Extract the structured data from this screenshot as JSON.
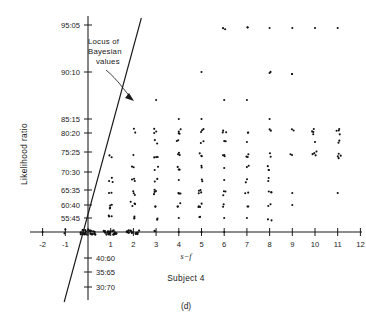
{
  "figure": {
    "panel_label": "(d)",
    "subject_label": "Subject 4",
    "x_axis_title": "s−f",
    "y_axis_title": "Likelihood ratio",
    "annotation": {
      "line1": "Locus of",
      "line2": "Bayesian",
      "line3": "values"
    },
    "ink_color": "#1a1a1a",
    "background_color": "#ffffff"
  },
  "chart_data": {
    "type": "scatter",
    "title": "",
    "subtitle": "Subject 4",
    "xlabel": "s−f",
    "ylabel": "Likelihood ratio",
    "xlim": [
      -2.6,
      12.8
    ],
    "ylim_index": [
      0,
      12
    ],
    "grid": false,
    "legend": "none",
    "x_ticks": [
      -2,
      -1,
      0,
      1,
      2,
      3,
      4,
      5,
      6,
      7,
      8,
      9,
      10,
      11,
      12
    ],
    "x_tick_labels": [
      "-2",
      "-1",
      "",
      "1",
      "2",
      "3",
      "4",
      "5",
      "6",
      "7",
      "8",
      "9",
      "10",
      "11",
      "12"
    ],
    "y_ticks_above_axis": [
      "95:05",
      "90:10",
      "85:15",
      "80:20",
      "75:25",
      "70:30",
      "65:35",
      "60:40",
      "55:45"
    ],
    "y_ticks_below_axis": [
      "40:60",
      "35:65",
      "30:70"
    ],
    "y_tick_pixel_y": {
      "95:05": 25,
      "90:10": 72,
      "85:15": 119,
      "80:20": 133,
      "75:25": 152,
      "70:30": 172,
      "65:35": 190,
      "60:40": 205,
      "55:45": 218,
      "50:50": 232,
      "40:60": 258,
      "35:65": 272,
      "30:70": 287
    },
    "locus_line": {
      "label": "Locus of Bayesian values",
      "x_start": -1.05,
      "y_pixel_start": 302,
      "x_end": 2.35,
      "y_pixel_end": 18,
      "description": "Straight diagonal line representing normative Bayesian likelihood ratio values"
    },
    "points": [
      {
        "x": -1.0,
        "y_px": 232,
        "n": 2
      },
      {
        "x": -2.0,
        "y_px": 232,
        "n": 1
      },
      {
        "x": 0.0,
        "y_px": 232,
        "n": 26
      },
      {
        "x": 1.0,
        "y_px": 232,
        "n": 22
      },
      {
        "x": 2.0,
        "y_px": 232,
        "n": 14
      },
      {
        "x": 3.0,
        "y_px": 232,
        "n": 2
      },
      {
        "x": 4.0,
        "y_px": 232,
        "n": 1
      },
      {
        "x": 5.0,
        "y_px": 232,
        "n": 1
      },
      {
        "x": 6.0,
        "y_px": 232,
        "n": 1
      },
      {
        "x": 1.0,
        "y_px": 218,
        "n": 3
      },
      {
        "x": 2.0,
        "y_px": 218,
        "n": 3
      },
      {
        "x": 3.0,
        "y_px": 218,
        "n": 2
      },
      {
        "x": 4.0,
        "y_px": 218,
        "n": 1
      },
      {
        "x": 5.0,
        "y_px": 218,
        "n": 2
      },
      {
        "x": 6.0,
        "y_px": 218,
        "n": 1
      },
      {
        "x": 7.0,
        "y_px": 218,
        "n": 1
      },
      {
        "x": 8.0,
        "y_px": 218,
        "n": 2
      },
      {
        "x": 1.0,
        "y_px": 205,
        "n": 4
      },
      {
        "x": 2.0,
        "y_px": 205,
        "n": 4
      },
      {
        "x": 3.0,
        "y_px": 205,
        "n": 2
      },
      {
        "x": 4.0,
        "y_px": 205,
        "n": 3
      },
      {
        "x": 5.0,
        "y_px": 205,
        "n": 4
      },
      {
        "x": 6.0,
        "y_px": 205,
        "n": 2
      },
      {
        "x": 7.0,
        "y_px": 205,
        "n": 2
      },
      {
        "x": 8.0,
        "y_px": 205,
        "n": 2
      },
      {
        "x": 9.0,
        "y_px": 205,
        "n": 1
      },
      {
        "x": 1.0,
        "y_px": 193,
        "n": 2
      },
      {
        "x": 2.0,
        "y_px": 193,
        "n": 3
      },
      {
        "x": 3.0,
        "y_px": 193,
        "n": 4
      },
      {
        "x": 4.0,
        "y_px": 193,
        "n": 3
      },
      {
        "x": 5.0,
        "y_px": 193,
        "n": 4
      },
      {
        "x": 6.0,
        "y_px": 193,
        "n": 3
      },
      {
        "x": 7.0,
        "y_px": 193,
        "n": 2
      },
      {
        "x": 8.0,
        "y_px": 193,
        "n": 3
      },
      {
        "x": 9.0,
        "y_px": 193,
        "n": 1
      },
      {
        "x": 11.0,
        "y_px": 193,
        "n": 1
      },
      {
        "x": 1.0,
        "y_px": 180,
        "n": 3
      },
      {
        "x": 2.0,
        "y_px": 180,
        "n": 3
      },
      {
        "x": 3.0,
        "y_px": 180,
        "n": 2
      },
      {
        "x": 4.0,
        "y_px": 180,
        "n": 1
      },
      {
        "x": 5.0,
        "y_px": 180,
        "n": 2
      },
      {
        "x": 6.0,
        "y_px": 180,
        "n": 1
      },
      {
        "x": 7.0,
        "y_px": 180,
        "n": 2
      },
      {
        "x": 8.0,
        "y_px": 180,
        "n": 2
      },
      {
        "x": 2.0,
        "y_px": 168,
        "n": 2
      },
      {
        "x": 3.0,
        "y_px": 168,
        "n": 2
      },
      {
        "x": 4.0,
        "y_px": 168,
        "n": 3
      },
      {
        "x": 5.0,
        "y_px": 168,
        "n": 2
      },
      {
        "x": 6.0,
        "y_px": 168,
        "n": 1
      },
      {
        "x": 7.0,
        "y_px": 168,
        "n": 2
      },
      {
        "x": 8.0,
        "y_px": 168,
        "n": 3
      },
      {
        "x": 1.0,
        "y_px": 155,
        "n": 2
      },
      {
        "x": 2.0,
        "y_px": 155,
        "n": 1
      },
      {
        "x": 3.0,
        "y_px": 155,
        "n": 3
      },
      {
        "x": 4.0,
        "y_px": 155,
        "n": 3
      },
      {
        "x": 5.0,
        "y_px": 155,
        "n": 3
      },
      {
        "x": 6.0,
        "y_px": 155,
        "n": 3
      },
      {
        "x": 7.0,
        "y_px": 155,
        "n": 3
      },
      {
        "x": 8.0,
        "y_px": 155,
        "n": 2
      },
      {
        "x": 9.0,
        "y_px": 155,
        "n": 2
      },
      {
        "x": 10.0,
        "y_px": 155,
        "n": 4
      },
      {
        "x": 11.0,
        "y_px": 155,
        "n": 4
      },
      {
        "x": 3.0,
        "y_px": 142,
        "n": 2
      },
      {
        "x": 4.0,
        "y_px": 142,
        "n": 2
      },
      {
        "x": 5.0,
        "y_px": 142,
        "n": 2
      },
      {
        "x": 6.0,
        "y_px": 142,
        "n": 2
      },
      {
        "x": 7.0,
        "y_px": 142,
        "n": 1
      },
      {
        "x": 10.0,
        "y_px": 142,
        "n": 1
      },
      {
        "x": 11.0,
        "y_px": 142,
        "n": 2
      },
      {
        "x": 2.0,
        "y_px": 131,
        "n": 2
      },
      {
        "x": 3.0,
        "y_px": 131,
        "n": 3
      },
      {
        "x": 4.0,
        "y_px": 131,
        "n": 4
      },
      {
        "x": 5.0,
        "y_px": 131,
        "n": 3
      },
      {
        "x": 6.0,
        "y_px": 131,
        "n": 3
      },
      {
        "x": 7.0,
        "y_px": 131,
        "n": 2
      },
      {
        "x": 8.0,
        "y_px": 131,
        "n": 2
      },
      {
        "x": 9.0,
        "y_px": 131,
        "n": 2
      },
      {
        "x": 10.0,
        "y_px": 131,
        "n": 4
      },
      {
        "x": 11.0,
        "y_px": 131,
        "n": 4
      },
      {
        "x": 4.0,
        "y_px": 119,
        "n": 1
      },
      {
        "x": 5.0,
        "y_px": 119,
        "n": 1
      },
      {
        "x": 8.0,
        "y_px": 119,
        "n": 1
      },
      {
        "x": 3.0,
        "y_px": 100,
        "n": 1
      },
      {
        "x": 6.0,
        "y_px": 100,
        "n": 1
      },
      {
        "x": 7.0,
        "y_px": 100,
        "n": 1
      },
      {
        "x": 5.0,
        "y_px": 72,
        "n": 1
      },
      {
        "x": 8.0,
        "y_px": 72,
        "n": 2
      },
      {
        "x": 9.0,
        "y_px": 72,
        "n": 2
      },
      {
        "x": 6.0,
        "y_px": 28,
        "n": 2
      },
      {
        "x": 7.0,
        "y_px": 28,
        "n": 2
      },
      {
        "x": 8.0,
        "y_px": 28,
        "n": 1
      },
      {
        "x": 9.0,
        "y_px": 28,
        "n": 1
      },
      {
        "x": 10.0,
        "y_px": 28,
        "n": 1
      },
      {
        "x": 11.0,
        "y_px": 28,
        "n": 1
      }
    ]
  }
}
